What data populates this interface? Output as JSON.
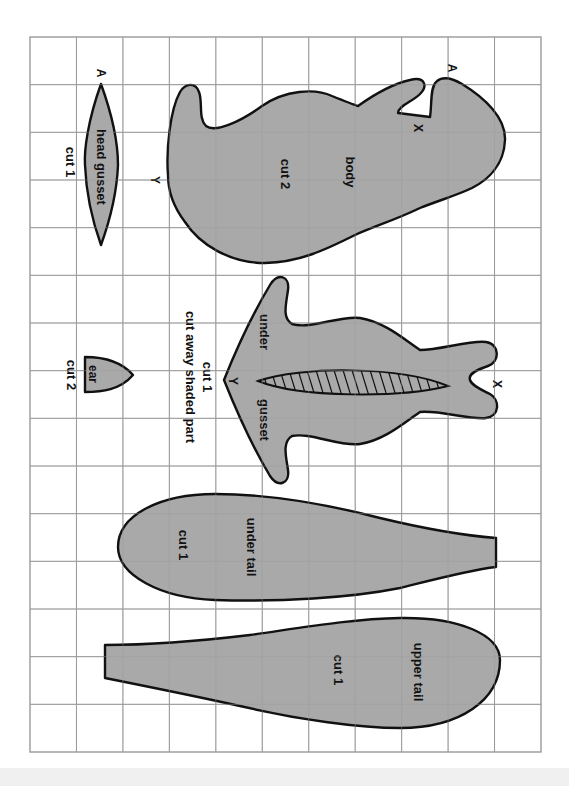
{
  "sheet": {
    "title": "Pattern pieces on square grid",
    "grid": {
      "columns": 11,
      "rows": 15,
      "left": 30,
      "top": 37,
      "right": 541,
      "bottom": 752
    },
    "colors": {
      "fill": "#a9a9a9",
      "outline": "#111111",
      "grid": "#9a9a9a",
      "paper": "#ffffff"
    }
  },
  "pieces": {
    "head_gusset": {
      "name": "head gusset",
      "instruction": "cut 1",
      "marker_top": "A"
    },
    "body": {
      "name": "body",
      "instruction": "cut 2",
      "marker_a": "A",
      "marker_x": "X",
      "marker_y": "Y"
    },
    "under_gusset": {
      "name_part1": "under",
      "name_part2": "gusset",
      "instruction": "cut 1",
      "note": "cut away shaded part",
      "marker_x": "X",
      "marker_y": "Y"
    },
    "ear": {
      "name": "ear",
      "instruction": "cut 2"
    },
    "under_tail": {
      "name": "under tail",
      "instruction": "cut 1"
    },
    "upper_tail": {
      "name": "upper tail",
      "instruction": "cut 1"
    }
  }
}
